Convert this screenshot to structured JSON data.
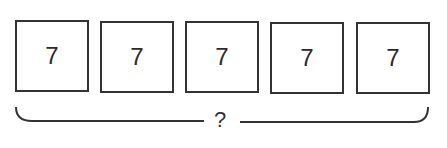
{
  "diagram": {
    "boxes": [
      {
        "value": "7"
      },
      {
        "value": "7"
      },
      {
        "value": "7"
      },
      {
        "value": "7"
      },
      {
        "value": "7"
      }
    ],
    "bracket_label": "?"
  },
  "colors": {
    "stroke": "#333333",
    "text": "#2b2b2b",
    "background": "#ffffff"
  }
}
